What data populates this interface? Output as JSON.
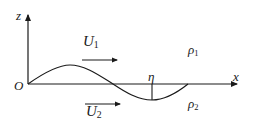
{
  "diagram": {
    "axes": {
      "z_label": "z",
      "x_label": "x",
      "origin_label": "O"
    },
    "upper_layer": {
      "velocity_symbol": "U",
      "velocity_subscript": "1",
      "density_symbol": "ρ",
      "density_subscript": "1"
    },
    "lower_layer": {
      "velocity_symbol": "U",
      "velocity_subscript": "2",
      "density_symbol": "ρ",
      "density_subscript": "2"
    },
    "displacement_label": "η",
    "colors": {
      "line": "#1a1a1a",
      "background": "#ffffff"
    }
  }
}
